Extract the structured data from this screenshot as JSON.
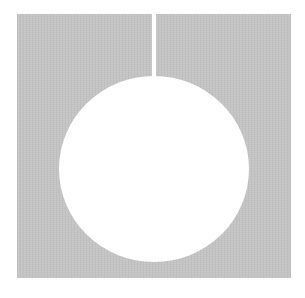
{
  "figure": {
    "shapes": [
      {
        "type": "square",
        "fill": "#c4c4c4",
        "description": "gray textured square"
      },
      {
        "type": "circle",
        "fill": "#ffffff",
        "description": "white circular hole"
      },
      {
        "type": "slit",
        "fill": "#ffffff",
        "description": "thin vertical cut from top edge to circle"
      }
    ],
    "colors": {
      "background": "#ffffff",
      "square": "#c4c4c4",
      "hole": "#ffffff"
    }
  }
}
